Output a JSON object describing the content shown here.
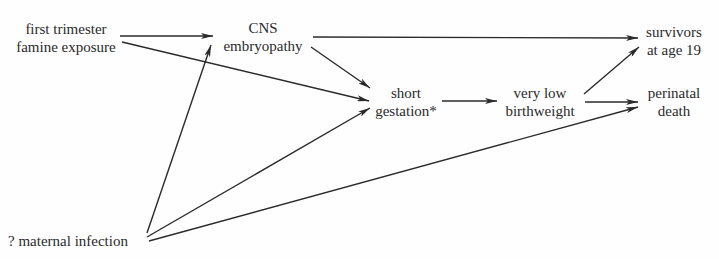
{
  "diagram": {
    "nodes": [
      {
        "id": "famine",
        "lines": [
          "first trimester",
          "famine exposure"
        ]
      },
      {
        "id": "cns",
        "lines": [
          "CNS",
          "embryopathy"
        ]
      },
      {
        "id": "short",
        "lines": [
          "short",
          "gestation*"
        ]
      },
      {
        "id": "vlbw",
        "lines": [
          "very low",
          "birthweight"
        ]
      },
      {
        "id": "survivors",
        "lines": [
          "survivors",
          "at age 19"
        ]
      },
      {
        "id": "perinatal",
        "lines": [
          "perinatal",
          "death"
        ]
      },
      {
        "id": "infection",
        "lines": [
          "? maternal infection"
        ]
      }
    ],
    "edges": [
      {
        "from": "famine",
        "to": "cns"
      },
      {
        "from": "famine",
        "to": "short"
      },
      {
        "from": "cns",
        "to": "survivors"
      },
      {
        "from": "cns",
        "to": "short"
      },
      {
        "from": "short",
        "to": "vlbw"
      },
      {
        "from": "vlbw",
        "to": "survivors"
      },
      {
        "from": "vlbw",
        "to": "perinatal"
      },
      {
        "from": "infection",
        "to": "cns"
      },
      {
        "from": "infection",
        "to": "short"
      },
      {
        "from": "infection",
        "to": "perinatal"
      }
    ],
    "colors": {
      "line": "#2a2a2a",
      "text": "#2a2a2a",
      "background": "#fefefe"
    }
  }
}
